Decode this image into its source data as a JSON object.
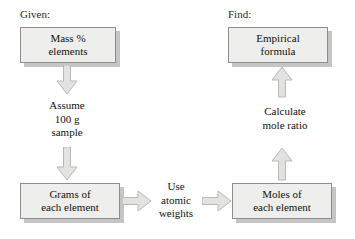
{
  "diagram": {
    "background_color": "#ffffff",
    "box_fill_color": "#eeeeec",
    "box_border_color": "#8d8d8d",
    "arrow_fill_color": "#e2e2e0",
    "arrow_border_color": "#b4b4b2",
    "text_color": "#111111",
    "labels": {
      "given": "Given:",
      "find": "Find:"
    },
    "nodes": [
      {
        "id": "mass-percent",
        "text": "Mass %\nelements"
      },
      {
        "id": "empirical-formula",
        "text": "Empirical\nformula"
      },
      {
        "id": "grams",
        "text": "Grams of\neach element"
      },
      {
        "id": "moles",
        "text": "Moles of\neach element"
      }
    ],
    "captions": [
      {
        "id": "assume-sample",
        "text": "Assume\n100 g\nsample"
      },
      {
        "id": "calculate-mole-ratio",
        "text": "Calculate\nmole ratio"
      },
      {
        "id": "use-atomic-weights",
        "text": "Use\natomic\nweights"
      }
    ],
    "arrows": [
      {
        "id": "mass-to-assume",
        "direction": "down"
      },
      {
        "id": "assume-to-grams",
        "direction": "down"
      },
      {
        "id": "grams-to-use",
        "direction": "right"
      },
      {
        "id": "use-to-moles",
        "direction": "right"
      },
      {
        "id": "moles-to-calculate",
        "direction": "up"
      },
      {
        "id": "calculate-to-formula",
        "direction": "up"
      }
    ]
  }
}
